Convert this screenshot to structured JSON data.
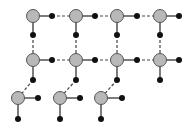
{
  "diagram": {
    "width": 188,
    "height": 129,
    "colors": {
      "grey_node_fill": "#b8b8b8",
      "grey_node_stroke": "#555555",
      "black_node": "#111111",
      "edge": "#444444"
    },
    "grey_nodes": [
      {
        "x": 33,
        "y": 16
      },
      {
        "x": 76,
        "y": 16
      },
      {
        "x": 117,
        "y": 16
      },
      {
        "x": 160,
        "y": 16
      },
      {
        "x": 33,
        "y": 60
      },
      {
        "x": 76,
        "y": 60
      },
      {
        "x": 117,
        "y": 60
      },
      {
        "x": 160,
        "y": 60
      },
      {
        "x": 18,
        "y": 98
      },
      {
        "x": 60,
        "y": 98
      },
      {
        "x": 101,
        "y": 98
      }
    ],
    "black_nodes": [
      {
        "x": 52,
        "y": 16
      },
      {
        "x": 95,
        "y": 16
      },
      {
        "x": 137,
        "y": 16
      },
      {
        "x": 179,
        "y": 16
      },
      {
        "x": 33,
        "y": 35
      },
      {
        "x": 76,
        "y": 35
      },
      {
        "x": 117,
        "y": 35
      },
      {
        "x": 160,
        "y": 35
      },
      {
        "x": 52,
        "y": 60
      },
      {
        "x": 95,
        "y": 60
      },
      {
        "x": 137,
        "y": 60
      },
      {
        "x": 179,
        "y": 60
      },
      {
        "x": 33,
        "y": 80
      },
      {
        "x": 76,
        "y": 80
      },
      {
        "x": 117,
        "y": 80
      },
      {
        "x": 160,
        "y": 80
      },
      {
        "x": 38,
        "y": 98
      },
      {
        "x": 80,
        "y": 98
      },
      {
        "x": 122,
        "y": 98
      },
      {
        "x": 18,
        "y": 119
      },
      {
        "x": 60,
        "y": 119
      },
      {
        "x": 101,
        "y": 119
      }
    ],
    "solid_edges": [
      [
        33,
        16,
        52,
        16
      ],
      [
        76,
        16,
        95,
        16
      ],
      [
        117,
        16,
        137,
        16
      ],
      [
        160,
        16,
        179,
        16
      ],
      [
        33,
        16,
        33,
        35
      ],
      [
        76,
        16,
        76,
        35
      ],
      [
        117,
        16,
        117,
        35
      ],
      [
        160,
        16,
        160,
        35
      ],
      [
        33,
        60,
        52,
        60
      ],
      [
        76,
        60,
        95,
        60
      ],
      [
        117,
        60,
        137,
        60
      ],
      [
        160,
        60,
        179,
        60
      ],
      [
        33,
        60,
        33,
        80
      ],
      [
        76,
        60,
        76,
        80
      ],
      [
        117,
        60,
        117,
        80
      ],
      [
        160,
        60,
        160,
        80
      ],
      [
        18,
        98,
        38,
        98
      ],
      [
        60,
        98,
        80,
        98
      ],
      [
        101,
        98,
        122,
        98
      ],
      [
        18,
        98,
        18,
        119
      ],
      [
        60,
        98,
        60,
        119
      ],
      [
        101,
        98,
        101,
        119
      ]
    ],
    "dashed_edges": [
      [
        52,
        16,
        76,
        16
      ],
      [
        95,
        16,
        117,
        16
      ],
      [
        137,
        16,
        160,
        16
      ],
      [
        33,
        35,
        33,
        60
      ],
      [
        76,
        35,
        76,
        60
      ],
      [
        117,
        35,
        117,
        60
      ],
      [
        160,
        35,
        160,
        60
      ],
      [
        52,
        60,
        76,
        60
      ],
      [
        95,
        60,
        117,
        60
      ],
      [
        137,
        60,
        160,
        60
      ],
      [
        33,
        80,
        18,
        98
      ],
      [
        76,
        80,
        60,
        98
      ],
      [
        117,
        80,
        101,
        98
      ]
    ]
  }
}
